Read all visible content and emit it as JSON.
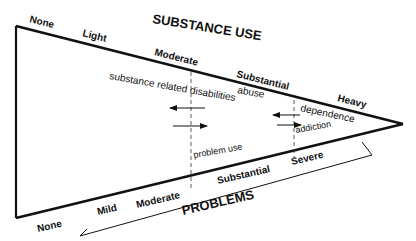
{
  "diagram": {
    "top_axis": {
      "title": "SUBSTANCE USE",
      "levels": [
        "None",
        "Light",
        "Moderate",
        "Substantial",
        "Heavy"
      ]
    },
    "bottom_axis": {
      "title": "PROBLEMS",
      "levels": [
        "None",
        "Mild",
        "Moderate",
        "Substantial",
        "Severe"
      ]
    },
    "inner_labels": {
      "srd": "substance related disabilities",
      "abuse": "abuse",
      "dependence": "dependence",
      "addiction": "addiction",
      "problem_use": "problem use"
    },
    "colors": {
      "stroke": "#111111",
      "background": "#ffffff"
    }
  }
}
